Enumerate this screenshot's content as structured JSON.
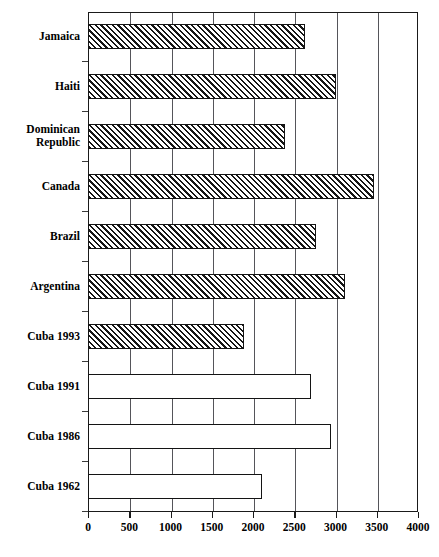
{
  "chart_data": {
    "type": "bar",
    "orientation": "horizontal",
    "title": "",
    "xlabel": "",
    "ylabel": "",
    "xlim": [
      0,
      4000
    ],
    "xticks": [
      0,
      500,
      1000,
      1500,
      2000,
      2500,
      3000,
      3500,
      4000
    ],
    "xtick_labels": [
      "0",
      "500",
      "1000",
      "1500",
      "2000",
      "2500",
      "3000",
      "3500",
      "4000"
    ],
    "grid": true,
    "grid_axis": "x",
    "legend": null,
    "categories": [
      "Jamaica",
      "Haiti",
      "Dominican Republic",
      "Canada",
      "Brazil",
      "Argentina",
      "Cuba 1993",
      "Cuba 1991",
      "Cuba 1986",
      "Cuba 1962"
    ],
    "values": [
      2630,
      3000,
      2390,
      3470,
      2760,
      3110,
      1890,
      2700,
      2940,
      2110
    ],
    "bar_styles": [
      "hatched",
      "hatched",
      "hatched",
      "hatched",
      "hatched",
      "hatched",
      "hatched",
      "open",
      "open",
      "open"
    ],
    "colors": {
      "bar_outline": "#141414",
      "bar_fill_open": "#ffffff",
      "hatch": "#161616",
      "grid": "#55555a",
      "axis": "#1a1a1a",
      "text": "#000000"
    }
  },
  "categories_display": [
    {
      "lines": [
        "Jamaica"
      ]
    },
    {
      "lines": [
        "Haiti"
      ]
    },
    {
      "lines": [
        "Dominican",
        "Republic"
      ]
    },
    {
      "lines": [
        "Canada"
      ]
    },
    {
      "lines": [
        "Brazil"
      ]
    },
    {
      "lines": [
        "Argentina"
      ]
    },
    {
      "lines": [
        "Cuba 1993"
      ]
    },
    {
      "lines": [
        "Cuba 1991"
      ]
    },
    {
      "lines": [
        "Cuba 1986"
      ]
    },
    {
      "lines": [
        "Cuba 1962"
      ]
    }
  ],
  "title_remnant": ""
}
